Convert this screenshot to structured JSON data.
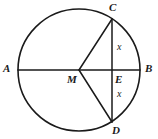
{
  "figure": {
    "kind": "circle-geometry-diagram",
    "width": 158,
    "height": 139,
    "background_color": "#ffffff",
    "stroke_color": "#1a1a1a",
    "text_color": "#1a1a1a"
  },
  "chart_data": {
    "type": "diagram",
    "title": "",
    "shapes": {
      "circle": {
        "center_label": "M",
        "cx": 79,
        "cy": 70,
        "r": 61,
        "stroke": "#1a1a1a",
        "stroke_width": 1.6,
        "fill": "none"
      },
      "segments": [
        {
          "name": "diameter-AB",
          "from": "A",
          "to": "B",
          "x1": 18,
          "y1": 70,
          "x2": 140,
          "y2": 70
        },
        {
          "name": "chord-CD",
          "from": "C",
          "to": "D",
          "x1": 112,
          "y1": 19,
          "x2": 112,
          "y2": 122
        },
        {
          "name": "radius-MC",
          "from": "M",
          "to": "C",
          "x1": 79,
          "y1": 70,
          "x2": 112,
          "y2": 19
        },
        {
          "name": "radius-MD",
          "from": "M",
          "to": "D",
          "x1": 79,
          "y1": 70,
          "x2": 112,
          "y2": 122
        }
      ],
      "points": [
        {
          "id": "A",
          "label": "A",
          "x": 18,
          "y": 70,
          "role": "endpoint-of-diameter"
        },
        {
          "id": "B",
          "label": "B",
          "x": 140,
          "y": 70,
          "role": "endpoint-of-diameter"
        },
        {
          "id": "C",
          "label": "C",
          "x": 112,
          "y": 19,
          "role": "endpoint-of-chord"
        },
        {
          "id": "D",
          "label": "D",
          "x": 112,
          "y": 122,
          "role": "endpoint-of-chord"
        },
        {
          "id": "M",
          "label": "M",
          "x": 79,
          "y": 70,
          "role": "circle-center"
        },
        {
          "id": "E",
          "label": "E",
          "x": 112,
          "y": 70,
          "role": "chord-diameter-intersection"
        }
      ]
    },
    "measure_labels": [
      {
        "id": "x-upper",
        "text": "x",
        "for_segment": "CE",
        "x": 118,
        "y": 46
      },
      {
        "id": "x-lower",
        "text": "x",
        "for_segment": "ED",
        "x": 118,
        "y": 93
      }
    ]
  },
  "labels": {
    "point_A": "A",
    "point_B": "B",
    "point_C": "C",
    "point_D": "D",
    "point_M": "M",
    "point_E": "E",
    "segment_x_upper": "x",
    "segment_x_lower": "x"
  }
}
